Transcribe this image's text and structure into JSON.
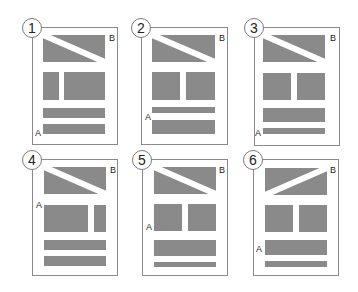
{
  "colors": {
    "block": "#8a8a8a",
    "frame": "#8a8a8a",
    "background": "#ffffff"
  },
  "panels": [
    {
      "number": "1",
      "label_a": "A",
      "label_b": "B",
      "frame": [
        32,
        27,
        86,
        118
      ],
      "hero": [
        43,
        35,
        62,
        27
      ],
      "diag": "down",
      "blocks": [
        [
          43,
          72,
          16,
          28
        ],
        [
          64,
          72,
          41,
          28
        ],
        [
          43,
          108,
          62,
          10
        ],
        [
          43,
          124,
          62,
          10
        ]
      ],
      "a_pos": [
        35,
        128
      ],
      "b_pos": [
        109,
        33
      ]
    },
    {
      "number": "2",
      "label_a": "A",
      "label_b": "B",
      "frame": [
        141,
        27,
        87,
        118
      ],
      "hero": [
        152,
        35,
        63,
        27
      ],
      "diag": "down",
      "blocks": [
        [
          152,
          72,
          28,
          28
        ],
        [
          186,
          72,
          29,
          28
        ],
        [
          152,
          107,
          63,
          6
        ],
        [
          152,
          120,
          63,
          14
        ]
      ],
      "a_pos": [
        145,
        112
      ],
      "b_pos": [
        219,
        33
      ]
    },
    {
      "number": "3",
      "label_a": "A",
      "label_b": "B",
      "frame": [
        254,
        27,
        86,
        119
      ],
      "hero": [
        263,
        35,
        62,
        27
      ],
      "diag": "down",
      "blocks": [
        [
          263,
          73,
          28,
          27
        ],
        [
          297,
          73,
          28,
          27
        ],
        [
          263,
          108,
          62,
          14
        ],
        [
          263,
          128,
          62,
          6
        ]
      ],
      "a_pos": [
        255,
        128
      ],
      "b_pos": [
        330,
        33
      ]
    },
    {
      "number": "4",
      "label_a": "A",
      "label_b": "B",
      "frame": [
        32,
        159,
        86,
        117
      ],
      "hero": [
        44,
        167,
        62,
        27
      ],
      "diag": "down",
      "blocks": [
        [
          44,
          205,
          44,
          27
        ],
        [
          94,
          205,
          12,
          27
        ],
        [
          44,
          240,
          62,
          10
        ],
        [
          44,
          256,
          62,
          10
        ]
      ],
      "a_pos": [
        36,
        200
      ],
      "b_pos": [
        110,
        165
      ]
    },
    {
      "number": "5",
      "label_a": "A",
      "label_b": "B",
      "frame": [
        142,
        159,
        86,
        117
      ],
      "hero": [
        154,
        167,
        62,
        27
      ],
      "diag": "down",
      "blocks": [
        [
          154,
          204,
          28,
          27
        ],
        [
          188,
          204,
          28,
          27
        ],
        [
          154,
          240,
          62,
          16
        ],
        [
          154,
          262,
          62,
          5
        ]
      ],
      "a_pos": [
        146,
        222
      ],
      "b_pos": [
        219,
        165
      ]
    },
    {
      "number": "6",
      "label_a": "A",
      "label_b": "B",
      "frame": [
        253,
        159,
        86,
        117
      ],
      "hero": [
        265,
        168,
        62,
        27
      ],
      "diag": "up",
      "blocks": [
        [
          265,
          205,
          28,
          27
        ],
        [
          299,
          205,
          28,
          27
        ],
        [
          265,
          240,
          62,
          15
        ],
        [
          265,
          261,
          62,
          6
        ]
      ],
      "a_pos": [
        256,
        244
      ],
      "b_pos": [
        330,
        165
      ]
    }
  ]
}
